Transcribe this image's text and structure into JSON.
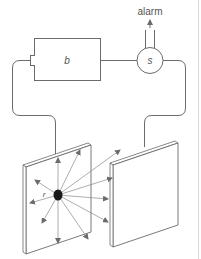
{
  "diagram": {
    "labels": {
      "alarm": "alarm",
      "battery": "b",
      "sensor": "s",
      "radius": "r"
    },
    "components": [
      {
        "id": "battery",
        "label": "b",
        "shape": "rectangle"
      },
      {
        "id": "sensor",
        "label": "s",
        "shape": "circle"
      },
      {
        "id": "left-plate",
        "shape": "plate",
        "has_charge": true
      },
      {
        "id": "right-plate",
        "shape": "plate",
        "has_charge": false
      }
    ],
    "output": {
      "label": "alarm",
      "direction": "up"
    },
    "colors": {
      "line": "#6b6b6b",
      "text": "#555555",
      "charge": "#1a1a1a",
      "background": "#ffffff"
    }
  }
}
